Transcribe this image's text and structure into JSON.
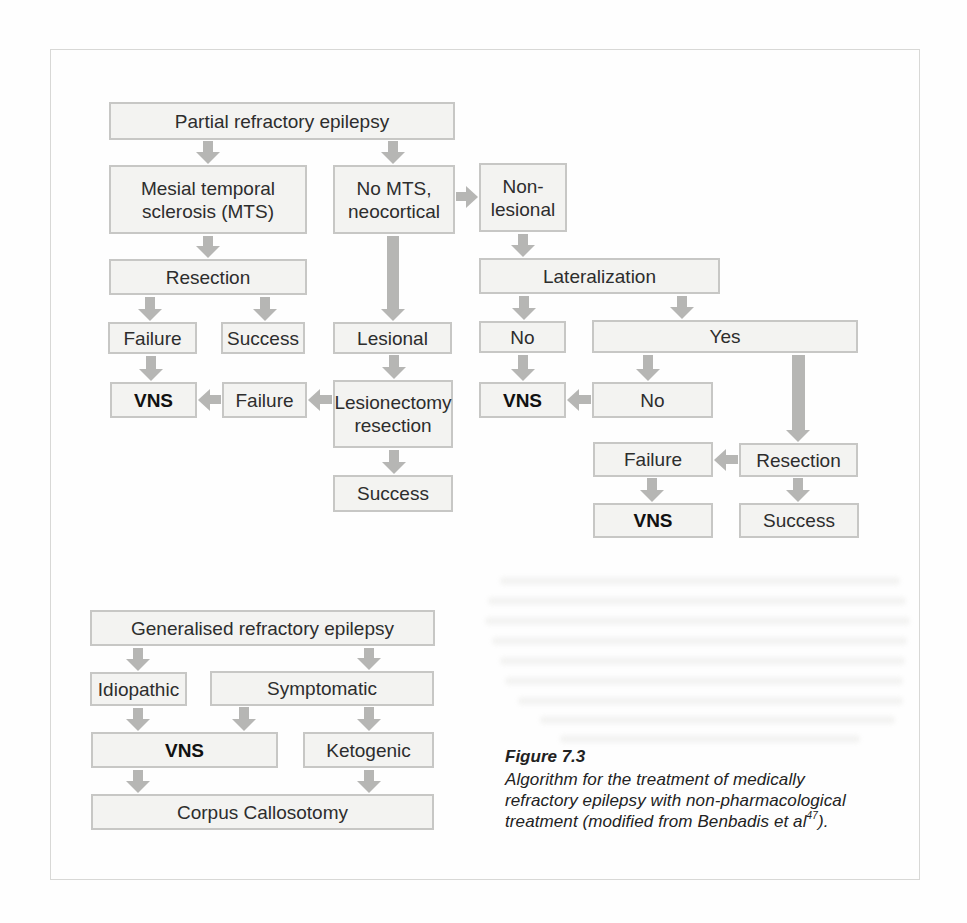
{
  "figure": {
    "caption_title": "Figure 7.3",
    "caption_line1": "Algorithm for the treatment of medically",
    "caption_line2": "refractory epilepsy with non-pharmacological",
    "caption_line3_pre": "treatment (modified from Benbadis et al",
    "caption_line3_sup": "47",
    "caption_line3_post": ")."
  },
  "colors": {
    "page_bg": "#fefefe",
    "panel_border": "#d8d8d6",
    "box_fill": "#f3f3f1",
    "box_border": "#c7c7c5",
    "arrow": "#b6b6b4",
    "text": "#2d2d2d"
  },
  "charts": [
    {
      "name": "partial-refractory-epilepsy-algorithm",
      "nodes": [
        {
          "id": "partial-refractory-epilepsy",
          "label": "Partial refractory epilepsy",
          "x": 109,
          "y": 102,
          "w": 346,
          "h": 38
        },
        {
          "id": "mesial-temporal-sclerosis",
          "label": "Mesial temporal\nsclerosis (MTS)",
          "x": 109,
          "y": 165,
          "w": 198,
          "h": 69
        },
        {
          "id": "no-mts-neocortical",
          "label": "No MTS,\nneocortical",
          "x": 333,
          "y": 165,
          "w": 122,
          "h": 69
        },
        {
          "id": "non-lesional",
          "label": "Non-\nlesional",
          "x": 479,
          "y": 163,
          "w": 88,
          "h": 69
        },
        {
          "id": "resection-mts",
          "label": "Resection",
          "x": 109,
          "y": 259,
          "w": 198,
          "h": 36
        },
        {
          "id": "failure-mts",
          "label": "Failure",
          "x": 108,
          "y": 322,
          "w": 89,
          "h": 32
        },
        {
          "id": "success-mts",
          "label": "Success",
          "x": 221,
          "y": 322,
          "w": 84,
          "h": 32
        },
        {
          "id": "lesional",
          "label": "Lesional",
          "x": 333,
          "y": 322,
          "w": 119,
          "h": 32
        },
        {
          "id": "vns-mts",
          "label": "VNS",
          "bold": true,
          "x": 110,
          "y": 382,
          "w": 87,
          "h": 36
        },
        {
          "id": "failure-lesionectomy",
          "label": "Failure",
          "x": 222,
          "y": 382,
          "w": 85,
          "h": 36
        },
        {
          "id": "lesionectomy-resection",
          "label": "Lesionectomy\nresection",
          "x": 333,
          "y": 380,
          "w": 120,
          "h": 68
        },
        {
          "id": "success-lesionectomy",
          "label": "Success",
          "x": 333,
          "y": 475,
          "w": 120,
          "h": 37
        },
        {
          "id": "lateralization",
          "label": "Lateralization",
          "x": 479,
          "y": 258,
          "w": 241,
          "h": 36
        },
        {
          "id": "no-lateralization",
          "label": "No",
          "x": 479,
          "y": 321,
          "w": 87,
          "h": 32
        },
        {
          "id": "yes-lateralization",
          "label": "Yes",
          "x": 592,
          "y": 320,
          "w": 266,
          "h": 33
        },
        {
          "id": "vns-no-lateralization",
          "label": "VNS",
          "bold": true,
          "x": 479,
          "y": 382,
          "w": 87,
          "h": 36
        },
        {
          "id": "no-resection",
          "label": "No",
          "x": 592,
          "y": 382,
          "w": 121,
          "h": 36
        },
        {
          "id": "failure-right",
          "label": "Failure",
          "x": 593,
          "y": 442,
          "w": 120,
          "h": 35
        },
        {
          "id": "resection-right",
          "label": "Resection",
          "x": 739,
          "y": 443,
          "w": 119,
          "h": 34
        },
        {
          "id": "vns-right",
          "label": "VNS",
          "bold": true,
          "x": 593,
          "y": 503,
          "w": 120,
          "h": 35
        },
        {
          "id": "success-right",
          "label": "Success",
          "x": 739,
          "y": 503,
          "w": 120,
          "h": 35
        }
      ],
      "arrows": [
        {
          "dir": "down",
          "cx": 208,
          "y": 141,
          "len": 23
        },
        {
          "dir": "down",
          "cx": 393,
          "y": 141,
          "len": 23
        },
        {
          "dir": "right",
          "x": 456,
          "cy": 197,
          "len": 22
        },
        {
          "dir": "down",
          "cx": 208,
          "y": 236,
          "len": 22
        },
        {
          "dir": "down",
          "cx": 150,
          "y": 297,
          "len": 24
        },
        {
          "dir": "down",
          "cx": 265,
          "y": 297,
          "len": 24
        },
        {
          "dir": "down",
          "cx": 151,
          "y": 356,
          "len": 25
        },
        {
          "dir": "left",
          "x": 198,
          "cy": 400,
          "len": 23
        },
        {
          "dir": "left",
          "x": 308,
          "cy": 400,
          "len": 24
        },
        {
          "dir": "down",
          "cx": 393,
          "y": 236,
          "len": 85,
          "sw": 12
        },
        {
          "dir": "down",
          "cx": 394,
          "y": 355,
          "len": 24
        },
        {
          "dir": "down",
          "cx": 394,
          "y": 450,
          "len": 24
        },
        {
          "dir": "down",
          "cx": 523,
          "y": 234,
          "len": 23
        },
        {
          "dir": "down",
          "cx": 524,
          "y": 296,
          "len": 24
        },
        {
          "dir": "down",
          "cx": 682,
          "y": 296,
          "len": 23
        },
        {
          "dir": "down",
          "cx": 523,
          "y": 355,
          "len": 26
        },
        {
          "dir": "down",
          "cx": 648,
          "y": 355,
          "len": 26
        },
        {
          "dir": "down",
          "cx": 798,
          "y": 355,
          "len": 87,
          "sw": 13
        },
        {
          "dir": "left",
          "x": 567,
          "cy": 400,
          "len": 24
        },
        {
          "dir": "left",
          "x": 714,
          "cy": 460,
          "len": 24
        },
        {
          "dir": "down",
          "cx": 652,
          "y": 478,
          "len": 24
        },
        {
          "dir": "down",
          "cx": 798,
          "y": 478,
          "len": 24
        }
      ]
    },
    {
      "name": "generalised-refractory-epilepsy-algorithm",
      "nodes": [
        {
          "id": "generalised-refractory-epilepsy",
          "label": "Generalised refractory epilepsy",
          "x": 90,
          "y": 610,
          "w": 345,
          "h": 36
        },
        {
          "id": "idiopathic",
          "label": "Idiopathic",
          "x": 90,
          "y": 672,
          "w": 97,
          "h": 34
        },
        {
          "id": "symptomatic",
          "label": "Symptomatic",
          "x": 210,
          "y": 671,
          "w": 224,
          "h": 35
        },
        {
          "id": "vns-generalised",
          "label": "VNS",
          "bold": true,
          "x": 91,
          "y": 732,
          "w": 187,
          "h": 36
        },
        {
          "id": "ketogenic",
          "label": "Ketogenic",
          "x": 303,
          "y": 732,
          "w": 131,
          "h": 36
        },
        {
          "id": "corpus-callosotomy",
          "label": "Corpus Callosotomy",
          "x": 91,
          "y": 794,
          "w": 343,
          "h": 36
        }
      ],
      "arrows": [
        {
          "dir": "down",
          "cx": 138,
          "y": 648,
          "len": 23
        },
        {
          "dir": "down",
          "cx": 369,
          "y": 648,
          "len": 22
        },
        {
          "dir": "down",
          "cx": 138,
          "y": 708,
          "len": 23
        },
        {
          "dir": "down",
          "cx": 244,
          "y": 707,
          "len": 24
        },
        {
          "dir": "down",
          "cx": 369,
          "y": 707,
          "len": 24
        },
        {
          "dir": "down",
          "cx": 138,
          "y": 770,
          "len": 23
        },
        {
          "dir": "down",
          "cx": 369,
          "y": 770,
          "len": 23
        }
      ]
    }
  ]
}
